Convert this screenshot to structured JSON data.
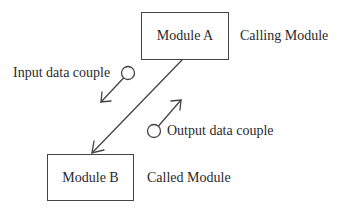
{
  "diagram": {
    "title": "",
    "modules": [
      {
        "id": "module-a",
        "label": "Module A",
        "role_label": "Calling Module"
      },
      {
        "id": "module-b",
        "label": "Module B",
        "role_label": "Called Module"
      }
    ],
    "couples": [
      {
        "id": "input",
        "label": "Input data couple",
        "direction": "A-to-B"
      },
      {
        "id": "output",
        "label": "Output data couple",
        "direction": "B-to-A"
      }
    ],
    "connection": {
      "from": "Module A",
      "to": "Module B",
      "arrow": "to Module B"
    },
    "colors": {
      "stroke": "#444444",
      "text": "#2a2a2a",
      "background": "#ffffff"
    }
  }
}
